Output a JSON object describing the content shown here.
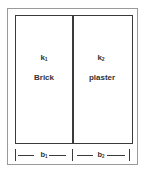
{
  "diagram": {
    "type": "composite-wall-cross-section",
    "layers": [
      {
        "conductivity_symbol": "k",
        "conductivity_sub": "1",
        "material": "Brick",
        "thickness_symbol": "b",
        "thickness_sub": "1"
      },
      {
        "conductivity_symbol": "k",
        "conductivity_sub": "2",
        "material": "plaster",
        "thickness_symbol": "b",
        "thickness_sub": "2"
      }
    ],
    "colors": {
      "line": "#3a3a3a",
      "frame": "#9a9a9a",
      "text": "#333333",
      "background": "#ffffff"
    }
  }
}
